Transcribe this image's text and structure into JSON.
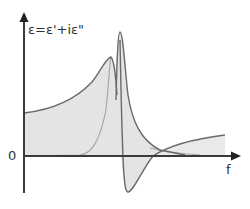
{
  "diagram": {
    "y_axis_label": "ε=ε'+iε\"",
    "x_axis_label": "f",
    "origin_label": "0",
    "curves": [
      {
        "name": "real-part",
        "symbol": "ε'",
        "description": "dispersion curve: rises to maximum, drops below zero to minimum, returns toward positive baseline"
      },
      {
        "name": "imaginary-part",
        "symbol": "ε\"",
        "description": "loss peak at resonance frequency"
      }
    ],
    "colors": {
      "axis": "#3a3a3a",
      "curve_dark": "#6a6a6a",
      "curve_light": "#a8a8a8",
      "fill": "#e4e4e4"
    }
  }
}
